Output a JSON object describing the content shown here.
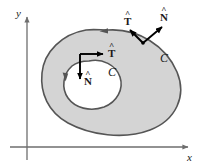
{
  "figure": {
    "type": "vector-calculus-region-diagram",
    "background_color": "#ffffff",
    "region_fill_color": "#d4d4d4",
    "curve_stroke_color": "#555555",
    "axis_color": "#6e6e6e",
    "vector_color": "#000000"
  },
  "axes": {
    "x_label": "x",
    "y_label": "y",
    "x_axis_y_px": 147,
    "y_axis_x_px": 27,
    "x_axis_arrow_tip_px": 191,
    "y_axis_arrow_tip_px": 14
  },
  "region": {
    "name": "shaded-annular-region",
    "outer_boundary_label": "C",
    "inner_boundary_label": "C",
    "description": "Shaded plane region bounded by an outer closed curve and an inner closed hole"
  },
  "vectors": [
    {
      "id": "outer-tangent",
      "symbol": "T",
      "hat": "^",
      "label": "T",
      "boundary": "outer",
      "direction": "up-left",
      "base_px": [
        143,
        43
      ],
      "tip_px": [
        128,
        29
      ],
      "label_px": [
        124,
        17
      ]
    },
    {
      "id": "outer-normal",
      "symbol": "N",
      "hat": "^",
      "label": "N",
      "boundary": "outer",
      "direction": "up-right",
      "base_px": [
        143,
        43
      ],
      "tip_px": [
        164,
        25
      ],
      "label_px": [
        162,
        13
      ]
    },
    {
      "id": "inner-tangent",
      "symbol": "T",
      "hat": "^",
      "label": "T",
      "boundary": "inner",
      "direction": "right",
      "base_px": [
        80,
        54
      ],
      "tip_px": [
        105,
        54
      ],
      "label_px": [
        109,
        49
      ]
    },
    {
      "id": "inner-normal",
      "symbol": "N",
      "hat": "^",
      "label": "N",
      "boundary": "inner",
      "direction": "down",
      "base_px": [
        80,
        54
      ],
      "tip_px": [
        80,
        81
      ],
      "label_px": [
        85,
        76
      ]
    }
  ],
  "curve_labels": [
    {
      "id": "outer-curve-label",
      "text": "C",
      "px": [
        162,
        54
      ]
    },
    {
      "id": "inner-curve-label",
      "text": "C",
      "px": [
        110,
        68
      ]
    }
  ],
  "orientation_markers": [
    {
      "id": "outer-orientation-arrow",
      "px": [
        103,
        31
      ],
      "direction": "leftward-counterclockwise"
    },
    {
      "id": "inner-orientation-arrow",
      "px": [
        65,
        77
      ],
      "direction": "downward-clockwise"
    }
  ]
}
